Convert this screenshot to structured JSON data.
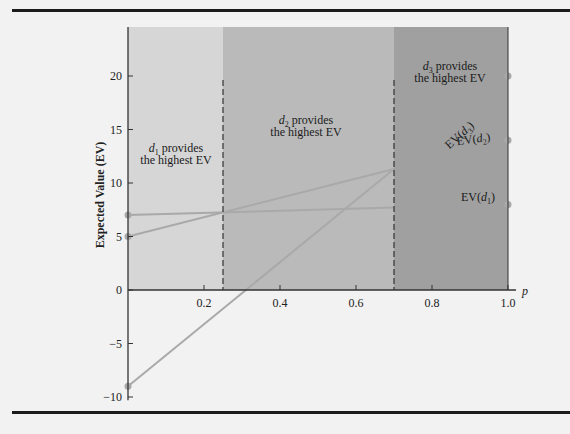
{
  "chart_data": {
    "type": "line",
    "title": "",
    "xlabel": "p",
    "ylabel": "Expected Value (EV)",
    "xlim": [
      0,
      1.0
    ],
    "ylim": [
      -10,
      24
    ],
    "x_ticks": [
      "0.2",
      "0.4",
      "0.6",
      "0.8",
      "1.0"
    ],
    "y_ticks": [
      "-10",
      "-5",
      "0",
      "5",
      "10",
      "15",
      "20"
    ],
    "grid": false,
    "x": [
      0,
      1
    ],
    "series": [
      {
        "name": "EV(d1)",
        "values": [
          7,
          8
        ]
      },
      {
        "name": "EV(d2)",
        "values": [
          5,
          14
        ]
      },
      {
        "name": "EV(d3)",
        "values": [
          -9,
          20
        ]
      }
    ],
    "regions": [
      {
        "from": 0,
        "to": 0.25,
        "label_main": "provides",
        "label_sub": "the highest EV",
        "decision": "d",
        "index": "1",
        "color": "#d6d6d6"
      },
      {
        "from": 0.25,
        "to": 0.7,
        "label_main": "provides",
        "label_sub": "the highest EV",
        "decision": "d",
        "index": "2",
        "color": "#bababa"
      },
      {
        "from": 0.7,
        "to": 1.0,
        "label_main": "provides",
        "label_sub": "the highest EV",
        "decision": "d",
        "index": "3",
        "color": "#a0a0a0"
      }
    ],
    "breakpoints": [
      0.25,
      0.7
    ],
    "line_labels": [
      {
        "text": "EV(",
        "var": "d",
        "index": "3",
        "close": ")"
      },
      {
        "text": "EV(",
        "var": "d",
        "index": "2",
        "close": ")"
      },
      {
        "text": "EV(",
        "var": "d",
        "index": "1",
        "close": ")"
      }
    ],
    "colors": {
      "line": "#a9a9a9",
      "axis": "#333333",
      "dashed": "#333333"
    }
  }
}
